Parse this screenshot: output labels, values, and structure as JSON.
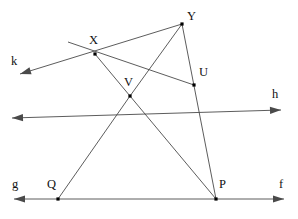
{
  "figure": {
    "type": "geometry-diagram",
    "width": 298,
    "height": 219,
    "background": "#ffffff",
    "stroke_color": "#4a4a4a",
    "point_color": "#000000",
    "label_color": "#111111"
  },
  "points": [
    {
      "name": "X",
      "label": "X",
      "x": 95,
      "y": 54,
      "label_x": 89,
      "label_y": 34
    },
    {
      "name": "Y",
      "label": "Y",
      "x": 182,
      "y": 24,
      "label_x": 187,
      "label_y": 10
    },
    {
      "name": "U",
      "label": "U",
      "x": 194,
      "y": 85,
      "label_x": 199,
      "label_y": 66
    },
    {
      "name": "V",
      "label": "V",
      "x": 130,
      "y": 96,
      "label_x": 124,
      "label_y": 76
    },
    {
      "name": "Q",
      "label": "Q",
      "x": 58,
      "y": 199,
      "label_x": 47,
      "label_y": 178
    },
    {
      "name": "P",
      "label": "P",
      "x": 216,
      "y": 199,
      "label_x": 219,
      "label_y": 178
    }
  ],
  "line_labels": [
    {
      "name": "k",
      "label": "k",
      "label_x": 11,
      "label_y": 55
    },
    {
      "name": "h",
      "label": "h",
      "label_x": 272,
      "label_y": 88
    },
    {
      "name": "g",
      "label": "g",
      "label_x": 12,
      "label_y": 178
    },
    {
      "name": "f",
      "label": "f",
      "label_x": 279,
      "label_y": 178
    }
  ],
  "segments": [
    {
      "name": "ray-k-through-X-to-Y",
      "x1": 20,
      "y1": 74,
      "x2": 182,
      "y2": 24,
      "arrow_start": true,
      "arrow_end": false
    },
    {
      "name": "line-X-to-U",
      "x1": 68,
      "y1": 42,
      "x2": 194,
      "y2": 85,
      "arrow_start": false,
      "arrow_end": false
    },
    {
      "name": "segment-X-to-V",
      "x1": 95,
      "y1": 54,
      "x2": 130,
      "y2": 96,
      "arrow_start": false,
      "arrow_end": false
    },
    {
      "name": "ray-through-V-and-U-to-h",
      "x1": 12,
      "y1": 118,
      "x2": 281,
      "y2": 110,
      "arrow_start": true,
      "arrow_end": true
    },
    {
      "name": "segment-Y-to-V",
      "x1": 182,
      "y1": 24,
      "x2": 130,
      "y2": 96,
      "arrow_start": false,
      "arrow_end": false
    },
    {
      "name": "segment-Y-through-U-to-P",
      "x1": 182,
      "y1": 24,
      "x2": 216,
      "y2": 199,
      "arrow_start": false,
      "arrow_end": false
    },
    {
      "name": "segment-V-to-Q",
      "x1": 130,
      "y1": 96,
      "x2": 58,
      "y2": 199,
      "arrow_start": false,
      "arrow_end": false
    },
    {
      "name": "segment-V-to-P",
      "x1": 130,
      "y1": 96,
      "x2": 216,
      "y2": 199,
      "arrow_start": false,
      "arrow_end": false
    },
    {
      "name": "line-g-f-horizontal",
      "x1": 14,
      "y1": 199,
      "x2": 284,
      "y2": 199,
      "arrow_start": true,
      "arrow_end": true
    }
  ]
}
